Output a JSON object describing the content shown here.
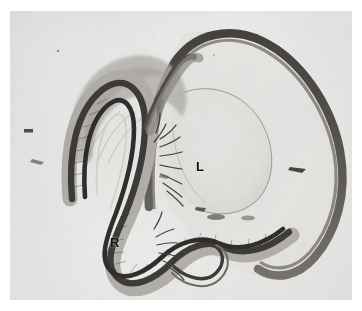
{
  "figure": {
    "kind": "histology-micrograph",
    "stain_tone": "grayscale",
    "plate_background": "#f3f3f2",
    "paper_margin": "#ffffff",
    "annotations": [
      {
        "id": "L",
        "text": "L",
        "meaning": "lens",
        "x": 196,
        "y": 156
      },
      {
        "id": "R",
        "text": "R",
        "meaning": "retina",
        "x": 110,
        "y": 232
      }
    ],
    "structures": [
      {
        "name": "sclera-outer-wall",
        "tone": "#4a4744",
        "description": "thick dark outer rim arcing across the top and right of the globe"
      },
      {
        "name": "lens-body",
        "tone": "#ececea",
        "description": "large pale ovoid occupying the right-centre of the globe"
      },
      {
        "name": "lens-capsule-line",
        "tone": "#9a9894",
        "description": "thin curved line outlining the anterior lens capsule"
      },
      {
        "name": "folded-retina",
        "tone": "#322f2d",
        "description": "dark multilayered band folded into a hairpin on the left and a wave along the bottom"
      },
      {
        "name": "ciliary-processes",
        "tone": "#4d4a47",
        "description": "feathery projections between retina fold and lens"
      },
      {
        "name": "vitreous-cavity",
        "tone": "#eeeeec",
        "description": "pale space enclosed by the scleral wall"
      },
      {
        "name": "debris-speck",
        "tone": "#3b3835",
        "description": "small dark artifact near the left margin"
      }
    ]
  },
  "colors": {
    "ink_dark": "#2e2b29",
    "ink_mid": "#6d6a66",
    "ink_light": "#a9a6a2",
    "tissue_pale": "#e6e5e2",
    "label_color": "#111111"
  }
}
